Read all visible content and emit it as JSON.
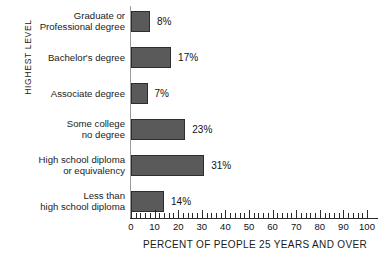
{
  "chart_data": {
    "type": "bar",
    "orientation": "horizontal",
    "title": "",
    "xlabel": "PERCENT OF PEOPLE 25 YEARS AND OVER",
    "ylabel": "HIGHEST LEVEL",
    "categories": [
      "Graduate or\nProfessional degree",
      "Bachelor's degree",
      "Associate degree",
      "Some college\nno degree",
      "High school diploma\nor equivalency",
      "Less than\nhigh school diploma"
    ],
    "values": [
      8,
      17,
      7,
      23,
      31,
      14
    ],
    "data_labels": [
      "8%",
      "17%",
      "7%",
      "23%",
      "31%",
      "14%"
    ],
    "xlim": [
      0,
      100
    ],
    "xticks": [
      0,
      10,
      20,
      30,
      40,
      50,
      60,
      70,
      80,
      90,
      100
    ],
    "xtick_labels": [
      "0",
      "10",
      "20",
      "30",
      "40",
      "50",
      "60",
      "70",
      "80",
      "90",
      "100"
    ],
    "minor_tick_step": 2,
    "grid": false,
    "legend": null,
    "colors": {
      "bar_fill": "#5a5a5a",
      "bar_border": "#2e2e2e",
      "axis": "#2a2a2a",
      "text": "#1a1a1a",
      "background": "#ffffff"
    }
  },
  "rows": [
    {
      "label_line1": "Graduate or",
      "label_line2": "Professional degree",
      "value": 8,
      "value_label": "8%"
    },
    {
      "label_line1": "Bachelor's degree",
      "label_line2": "",
      "value": 17,
      "value_label": "17%"
    },
    {
      "label_line1": "Associate degree",
      "label_line2": "",
      "value": 7,
      "value_label": "7%"
    },
    {
      "label_line1": "Some college",
      "label_line2": "no degree",
      "value": 23,
      "value_label": "23%"
    },
    {
      "label_line1": "High school diploma",
      "label_line2": "or equivalency",
      "value": 31,
      "value_label": "31%"
    },
    {
      "label_line1": "Less than",
      "label_line2": "high school diploma",
      "value": 14,
      "value_label": "14%"
    }
  ],
  "axis": {
    "y_title": "HIGHEST LEVEL",
    "x_title": "PERCENT OF PEOPLE 25 YEARS AND OVER"
  }
}
